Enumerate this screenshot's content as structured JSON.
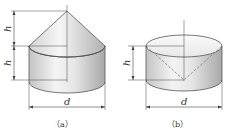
{
  "figures": [
    {
      "id": "a",
      "caption": "（a）",
      "description": "cylinder with cone on top",
      "labels": {
        "cone_height": "h",
        "cylinder_height": "h",
        "diameter": "d"
      }
    },
    {
      "id": "b",
      "caption": "（b）",
      "description": "cylinder with inverted cone cavity (dashed)",
      "labels": {
        "height": "h",
        "diameter": "d"
      }
    }
  ],
  "colors": {
    "outline": "#555555",
    "fill_light": "#f2f2f2",
    "fill_dark": "#b8b8b8",
    "dashed": "#777777"
  }
}
